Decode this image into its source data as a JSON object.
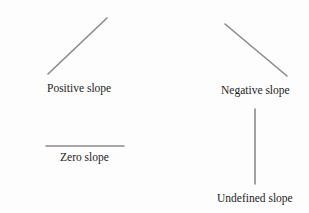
{
  "diagram": {
    "line_color": "#8a8a8a",
    "text_color": "#222222",
    "items": [
      {
        "name": "positive",
        "label": "Positive slope",
        "line": {
          "x1": 48,
          "y1": 74,
          "x2": 107,
          "y2": 18
        },
        "label_pos": {
          "x": 47,
          "y": 83
        }
      },
      {
        "name": "negative",
        "label": "Negative slope",
        "line": {
          "x1": 225,
          "y1": 24,
          "x2": 287,
          "y2": 76
        },
        "label_pos": {
          "x": 221,
          "y": 85
        }
      },
      {
        "name": "zero",
        "label": "Zero slope",
        "line": {
          "x1": 46,
          "y1": 146,
          "x2": 124,
          "y2": 146
        },
        "label_pos": {
          "x": 60,
          "y": 152
        }
      },
      {
        "name": "undefined",
        "label": "Undefined slope",
        "line": {
          "x1": 255,
          "y1": 109,
          "x2": 255,
          "y2": 184
        },
        "label_pos": {
          "x": 217,
          "y": 193
        }
      }
    ]
  }
}
